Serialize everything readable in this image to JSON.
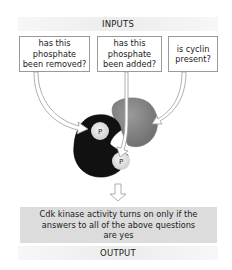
{
  "header": {
    "label": "INPUTS"
  },
  "questions": [
    {
      "id": "removed",
      "text": "has this\nphosphate\nbeen removed?"
    },
    {
      "id": "added",
      "text": "has this\nphosphate\nbeen added?"
    },
    {
      "id": "cyclin",
      "text": "is cyclin\npresent?"
    }
  ],
  "molecules": {
    "kinase": {
      "name": "Cdk",
      "color": "#111111"
    },
    "cyclin": {
      "name": "cyclin",
      "color": "#8a8a8a"
    },
    "phosphate_label_1": "P",
    "phosphate_label_2": "P"
  },
  "result": {
    "text": "Cdk kinase activity turns on only if the\nanswers to all of the above questions\nare yes"
  },
  "footer": {
    "label": "OUTPUT"
  }
}
